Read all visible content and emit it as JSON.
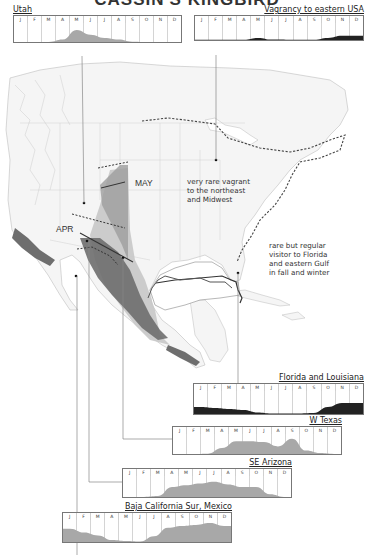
{
  "title": "CASSIN'S KINGBIRD",
  "map": {
    "annotations": {
      "may": "MAY",
      "apr": "APR",
      "northeast_note": [
        "very rare vagrant",
        "to the northeast",
        "and Midwest"
      ],
      "gulf_note": [
        "rare but regular",
        "visitor to Florida",
        "and eastern Gulf",
        "in fall and winter"
      ]
    },
    "colors": {
      "range_dark": "#6e6e6e",
      "range_mid": "#9a9a9a",
      "range_light": "#c8c8c8",
      "land": "#f4f4f4",
      "border": "#cccccc",
      "dashed_line": "#444444"
    }
  },
  "months": [
    "J",
    "F",
    "M",
    "A",
    "M",
    "J",
    "J",
    "A",
    "S",
    "O",
    "N",
    "D"
  ],
  "chart_data": [
    {
      "type": "area",
      "title": "Utah",
      "categories": [
        "J",
        "F",
        "M",
        "A",
        "M",
        "J",
        "J",
        "A",
        "S",
        "O",
        "N",
        "D"
      ],
      "values": [
        0,
        0,
        0,
        0.15,
        0.75,
        0.45,
        0.25,
        0.15,
        0.02,
        0,
        0,
        0
      ],
      "fill": "#a8a8a8",
      "ylim": [
        0,
        1
      ]
    },
    {
      "type": "area",
      "title": "Vagrancy to eastern USA",
      "categories": [
        "J",
        "F",
        "M",
        "A",
        "M",
        "J",
        "J",
        "A",
        "S",
        "O",
        "N",
        "D"
      ],
      "values": [
        0.02,
        0.02,
        0.02,
        0.02,
        0.15,
        0.03,
        0.02,
        0.02,
        0.02,
        0.15,
        0.3,
        0.3
      ],
      "fill": "#222222",
      "ylim": [
        0,
        1
      ]
    },
    {
      "type": "area",
      "title": "Florida and Louisiana",
      "categories": [
        "J",
        "F",
        "M",
        "A",
        "M",
        "J",
        "J",
        "A",
        "S",
        "O",
        "N",
        "D"
      ],
      "values": [
        0.35,
        0.3,
        0.25,
        0.2,
        0.08,
        0.03,
        0.03,
        0.03,
        0.05,
        0.35,
        0.55,
        0.55
      ],
      "fill": "#222222",
      "ylim": [
        0,
        1
      ]
    },
    {
      "type": "area",
      "title": "W Texas",
      "categories": [
        "J",
        "F",
        "M",
        "A",
        "M",
        "J",
        "J",
        "A",
        "S",
        "O",
        "N",
        "D"
      ],
      "values": [
        0,
        0,
        0.02,
        0.35,
        0.75,
        0.75,
        0.7,
        0.45,
        0.9,
        0.2,
        0.05,
        0
      ],
      "fill": "#a8a8a8",
      "ylim": [
        0,
        1
      ]
    },
    {
      "type": "area",
      "title": "SE Arizona",
      "categories": [
        "J",
        "F",
        "M",
        "A",
        "M",
        "J",
        "J",
        "A",
        "S",
        "O",
        "N",
        "D"
      ],
      "values": [
        0,
        0,
        0.05,
        0.55,
        0.65,
        0.75,
        0.85,
        0.7,
        0.55,
        0.55,
        0.15,
        0
      ],
      "fill": "#a8a8a8",
      "ylim": [
        0,
        1
      ]
    },
    {
      "type": "area",
      "title": "Baja California Sur, Mexico",
      "categories": [
        "J",
        "F",
        "M",
        "A",
        "M",
        "J",
        "J",
        "A",
        "S",
        "O",
        "N",
        "D"
      ],
      "values": [
        0.7,
        0.5,
        0.35,
        0.1,
        0.05,
        0.02,
        0.3,
        0.75,
        0.85,
        0.9,
        1.0,
        0.85
      ],
      "fill": "#a8a8a8",
      "ylim": [
        0,
        1
      ]
    }
  ]
}
